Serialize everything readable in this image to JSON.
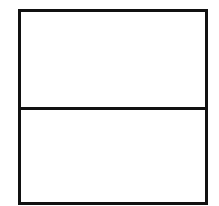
{
  "diagram": {
    "type": "two-panel-rectangle",
    "panels": [
      {
        "id": "top",
        "label": ""
      },
      {
        "id": "bottom",
        "label": ""
      }
    ],
    "colors": {
      "border": "#111111",
      "fill": "#ffffff"
    }
  }
}
